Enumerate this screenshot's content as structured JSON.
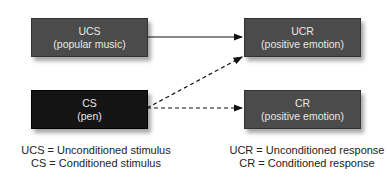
{
  "boxes": {
    "ucs": {
      "title": "UCS",
      "subtitle": "(popular music)",
      "color": "#4b4b4b"
    },
    "ucr": {
      "title": "UCR",
      "subtitle": "(positive emotion)",
      "color": "#4b4b4b"
    },
    "cs": {
      "title": "CS",
      "subtitle": "(pen)",
      "color": "#141414"
    },
    "cr": {
      "title": "CR",
      "subtitle": "(positive emotion)",
      "color": "#4b4b4b"
    }
  },
  "arrows": [
    {
      "from": "UCS",
      "to": "UCR",
      "style": "solid"
    },
    {
      "from": "CS",
      "to": "UCR",
      "style": "dashed"
    },
    {
      "from": "CS",
      "to": "CR",
      "style": "dashed"
    }
  ],
  "legend": {
    "left": [
      "UCS = Unconditioned stimulus",
      "CS = Conditioned stimulus"
    ],
    "right": [
      "UCR = Unconditioned response",
      "CR = Conditioned response"
    ]
  }
}
